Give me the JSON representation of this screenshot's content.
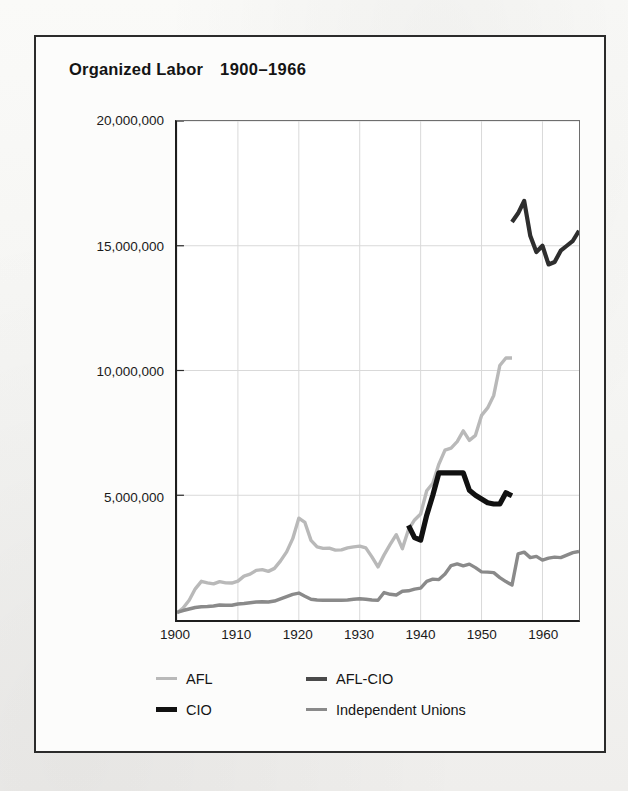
{
  "figure": {
    "title_main": "Organized Labor",
    "title_years": "1900–1966"
  },
  "legend": {
    "items": [
      {
        "label": "AFL",
        "color": "#b9b9b9",
        "thickness": 3
      },
      {
        "label": "AFL-CIO",
        "color": "#4a4a4a",
        "thickness": 4
      },
      {
        "label": "CIO",
        "color": "#111111",
        "thickness": 5
      },
      {
        "label": "Independent Unions",
        "color": "#8a8a8a",
        "thickness": 3
      }
    ]
  },
  "chart_data": {
    "type": "line",
    "xlabel": "",
    "ylabel": "",
    "xlim": [
      1900,
      1966
    ],
    "ylim": [
      0,
      20000000
    ],
    "grid": true,
    "legend_position": "bottom",
    "xticks": [
      1900,
      1910,
      1920,
      1930,
      1940,
      1950,
      1960
    ],
    "xticklabels": [
      "1900",
      "1910",
      "1920",
      "1930",
      "1940",
      "1950",
      "1960"
    ],
    "yticks": [
      5000000,
      10000000,
      15000000,
      20000000
    ],
    "yticklabels": [
      "5,000,000",
      "10,000,000",
      "15,000,000",
      "20,000,000"
    ],
    "series": [
      {
        "name": "AFL",
        "color": "#b9b9b9",
        "thickness": 3.4,
        "x": [
          1900,
          1901,
          1902,
          1903,
          1904,
          1905,
          1906,
          1907,
          1908,
          1909,
          1910,
          1911,
          1912,
          1913,
          1914,
          1915,
          1916,
          1917,
          1918,
          1919,
          1920,
          1921,
          1922,
          1923,
          1924,
          1925,
          1926,
          1927,
          1928,
          1929,
          1930,
          1931,
          1932,
          1933,
          1934,
          1935,
          1936,
          1937,
          1938,
          1939,
          1940,
          1941,
          1942,
          1943,
          1944,
          1945,
          1946,
          1947,
          1948,
          1949,
          1950,
          1951,
          1952,
          1953,
          1954,
          1955
        ],
        "y": [
          280000,
          480000,
          790000,
          1250000,
          1550000,
          1490000,
          1450000,
          1540000,
          1490000,
          1480000,
          1560000,
          1760000,
          1840000,
          1990000,
          2020000,
          1950000,
          2070000,
          2370000,
          2730000,
          3260000,
          4080000,
          3910000,
          3190000,
          2930000,
          2870000,
          2880000,
          2800000,
          2810000,
          2890000,
          2930000,
          2960000,
          2890000,
          2530000,
          2130000,
          2610000,
          3030000,
          3420000,
          2860000,
          3620000,
          4010000,
          4250000,
          5180000,
          5480000,
          6250000,
          6810000,
          6890000,
          7150000,
          7580000,
          7200000,
          7400000,
          8200000,
          8500000,
          9000000,
          10200000,
          10500000,
          10500000
        ]
      },
      {
        "name": "CIO",
        "color": "#111111",
        "thickness": 5.2,
        "x": [
          1938,
          1939,
          1940,
          1941,
          1942,
          1943,
          1944,
          1945,
          1946,
          1947,
          1948,
          1949,
          1950,
          1951,
          1952,
          1953,
          1954,
          1955
        ],
        "y": [
          3790000,
          3300000,
          3200000,
          4200000,
          5000000,
          5900000,
          5900000,
          5900000,
          5900000,
          5900000,
          5200000,
          5000000,
          4850000,
          4700000,
          4650000,
          4650000,
          5100000,
          4980000
        ]
      },
      {
        "name": "AFL-CIO",
        "color": "#2e2e2e",
        "thickness": 4.2,
        "x": [
          1955,
          1956,
          1957,
          1958,
          1959,
          1960,
          1961,
          1962,
          1963,
          1964,
          1965,
          1966
        ],
        "y": [
          15950000,
          16300000,
          16800000,
          15400000,
          14750000,
          15000000,
          14250000,
          14350000,
          14800000,
          15000000,
          15200000,
          15600000
        ]
      },
      {
        "name": "Independent Unions",
        "color": "#8a8a8a",
        "thickness": 3.4,
        "x": [
          1900,
          1901,
          1902,
          1903,
          1904,
          1905,
          1906,
          1907,
          1908,
          1909,
          1910,
          1911,
          1912,
          1913,
          1914,
          1915,
          1916,
          1917,
          1918,
          1919,
          1920,
          1921,
          1922,
          1923,
          1924,
          1925,
          1926,
          1927,
          1928,
          1929,
          1930,
          1931,
          1932,
          1933,
          1934,
          1935,
          1936,
          1937,
          1938,
          1939,
          1940,
          1941,
          1942,
          1943,
          1944,
          1945,
          1946,
          1947,
          1948,
          1949,
          1950,
          1951,
          1952,
          1953,
          1954,
          1955,
          1956,
          1957,
          1958,
          1959,
          1960,
          1961,
          1962,
          1963,
          1964,
          1965,
          1966
        ],
        "y": [
          310000,
          380000,
          440000,
          500000,
          530000,
          540000,
          560000,
          600000,
          590000,
          590000,
          640000,
          660000,
          690000,
          720000,
          730000,
          720000,
          760000,
          850000,
          940000,
          1030000,
          1080000,
          950000,
          830000,
          800000,
          790000,
          790000,
          790000,
          790000,
          800000,
          830000,
          850000,
          830000,
          800000,
          790000,
          1100000,
          1030000,
          1000000,
          1150000,
          1170000,
          1240000,
          1280000,
          1550000,
          1640000,
          1620000,
          1840000,
          2180000,
          2250000,
          2170000,
          2240000,
          2100000,
          1930000,
          1920000,
          1900000,
          1700000,
          1540000,
          1400000,
          2650000,
          2720000,
          2500000,
          2550000,
          2400000,
          2480000,
          2520000,
          2500000,
          2600000,
          2700000,
          2750000
        ]
      }
    ]
  }
}
